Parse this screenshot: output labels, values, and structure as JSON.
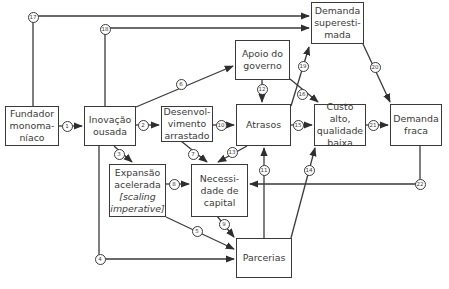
{
  "diagram": {
    "nodes": {
      "fundador": {
        "lines": [
          "Fundador",
          "monoma-",
          "níaco"
        ]
      },
      "inovacao": {
        "lines": [
          "Inovação",
          "ousada"
        ]
      },
      "desenvolvimento": {
        "lines": [
          "Desenvol-",
          "vimento",
          "arrastado"
        ]
      },
      "apoio": {
        "lines": [
          "Apoio do",
          "governo"
        ]
      },
      "demanda_super": {
        "lines": [
          "Demanda",
          "superesti-",
          "mada"
        ]
      },
      "atrasos": {
        "lines": [
          "Atrasos"
        ]
      },
      "custo": {
        "lines": [
          "Custo alto,",
          "qualidade",
          "baixa"
        ]
      },
      "demanda_fraca": {
        "lines": [
          "Demanda",
          "fraca"
        ]
      },
      "expansao": {
        "lines": [
          "Expansão",
          "acelerada",
          "[scaling",
          "imperative]"
        ]
      },
      "necessidade": {
        "lines": [
          "Necessi-",
          "dade de",
          "capital"
        ]
      },
      "parcerias": {
        "lines": [
          "Parcerias"
        ]
      }
    },
    "edge_labels": {
      "e1": "1",
      "e2": "2",
      "e3": "3",
      "e4": "4",
      "e5": "5",
      "e6": "6",
      "e7": "7",
      "e8": "8",
      "e9": "9",
      "e10": "10",
      "e11": "11",
      "e12": "12",
      "e13": "13",
      "e14": "14",
      "e15": "15",
      "e16": "16",
      "e17": "17",
      "e18": "18",
      "e19": "19",
      "e20": "20",
      "e21": "21",
      "e22": "22"
    },
    "edges": [
      {
        "id": "1",
        "from": "Fundador monomaníaco",
        "to": "Inovação ousada"
      },
      {
        "id": "2",
        "from": "Inovação ousada",
        "to": "Desenvolvimento arrastado"
      },
      {
        "id": "3",
        "from": "Inovação ousada",
        "to": "Expansão acelerada"
      },
      {
        "id": "4",
        "from": "Inovação ousada",
        "to": "Parcerias"
      },
      {
        "id": "5",
        "from": "Expansão acelerada",
        "to": "Parcerias"
      },
      {
        "id": "6",
        "from": "Inovação ousada",
        "to": "Apoio do governo"
      },
      {
        "id": "7",
        "from": "Desenvolvimento arrastado",
        "to": "Necessidade de capital"
      },
      {
        "id": "8",
        "from": "Expansão acelerada",
        "to": "Necessidade de capital"
      },
      {
        "id": "9",
        "from": "Necessidade de capital",
        "to": "Parcerias"
      },
      {
        "id": "10",
        "from": "Desenvolvimento arrastado",
        "to": "Atrasos"
      },
      {
        "id": "11",
        "from": "Parcerias",
        "to": "Atrasos"
      },
      {
        "id": "12",
        "from": "Apoio do governo",
        "to": "Atrasos"
      },
      {
        "id": "13",
        "from": "Atrasos",
        "to": "Necessidade de capital"
      },
      {
        "id": "14",
        "from": "Parcerias",
        "to": "Custo alto, qualidade baixa"
      },
      {
        "id": "15",
        "from": "Atrasos",
        "to": "Custo alto, qualidade baixa"
      },
      {
        "id": "16",
        "from": "Apoio do governo",
        "to": "Custo alto, qualidade baixa"
      },
      {
        "id": "17",
        "from": "Fundador monomaníaco",
        "to": "Demanda superestimada"
      },
      {
        "id": "18",
        "from": "Inovação ousada",
        "to": "Demanda superestimada"
      },
      {
        "id": "19",
        "from": "Atrasos",
        "to": "Demanda superestimada"
      },
      {
        "id": "20",
        "from": "Demanda superestimada",
        "to": "Demanda fraca"
      },
      {
        "id": "21",
        "from": "Custo alto, qualidade baixa",
        "to": "Demanda fraca"
      },
      {
        "id": "22",
        "from": "Demanda fraca",
        "to": "Necessidade de capital"
      }
    ]
  }
}
